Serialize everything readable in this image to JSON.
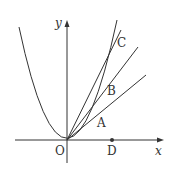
{
  "diagram": {
    "axes": {
      "x_label": "x",
      "y_label": "y",
      "origin_label": "O"
    },
    "points": {
      "A": "A",
      "B": "B",
      "C": "C",
      "D": "D"
    },
    "colors": {
      "stroke": "#333333",
      "background": "#ffffff"
    }
  }
}
